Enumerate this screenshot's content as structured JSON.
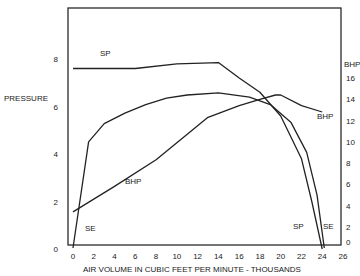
{
  "chart_data": {
    "type": "line",
    "title": "",
    "xlabel": "AIR VOLUME IN CUBIC FEET PER MINUTE - THOUSANDS",
    "ylabel": "PRESSURE",
    "y2label": "BHP",
    "xlim": [
      0,
      26
    ],
    "ylim": [
      0,
      10
    ],
    "y2lim": [
      0,
      18
    ],
    "grid": false,
    "legend": "inline labels",
    "x_ticks": [
      "0",
      "2",
      "4",
      "6",
      "8",
      "10",
      "12",
      "14",
      "16",
      "18",
      "20",
      "22",
      "24",
      "26"
    ],
    "y_ticks": [
      "0",
      "2",
      "4",
      "6",
      "8"
    ],
    "y2_ticks": [
      "0",
      "2",
      "4",
      "6",
      "8",
      "10",
      "12",
      "14",
      "16"
    ],
    "series": [
      {
        "name": "SP",
        "axis": "left",
        "description": "Static pressure",
        "x": [
          0,
          6,
          10,
          14,
          16,
          18,
          20,
          22,
          23,
          24
        ],
        "y": [
          7.6,
          7.6,
          7.8,
          7.85,
          7.2,
          6.6,
          5.6,
          3.8,
          2.0,
          0.0
        ]
      },
      {
        "name": "SE",
        "axis": "right",
        "description": "Static efficiency",
        "x": [
          0,
          1.5,
          3,
          5,
          7,
          9,
          11,
          14,
          17,
          19,
          21,
          22.5,
          23.5,
          24.2
        ],
        "y": [
          0,
          10.0,
          11.7,
          12.7,
          13.5,
          14.1,
          14.4,
          14.6,
          14.2,
          13.5,
          11.8,
          9.0,
          5.0,
          0.0
        ]
      },
      {
        "name": "BHP",
        "axis": "right",
        "description": "Brake horsepower",
        "x": [
          0,
          4,
          8,
          13,
          16,
          18,
          19.5,
          20,
          22,
          24
        ],
        "y": [
          3.4,
          5.8,
          8.3,
          12.3,
          13.4,
          14.0,
          14.4,
          14.4,
          13.4,
          12.8
        ]
      }
    ],
    "annotations": [
      {
        "text": "SP",
        "x": 4,
        "y_left": 8.2
      },
      {
        "text": "BHP",
        "x": 8,
        "y_left": 2.9
      },
      {
        "text": "SE",
        "x": 1.5,
        "y_left": 1.0
      },
      {
        "text": "BHP",
        "x": 24.5,
        "y_left": 5.6
      },
      {
        "text": "SP",
        "x": 22.5,
        "y_left": 0.9
      },
      {
        "text": "SE",
        "x": 25,
        "y_left": 0.9
      }
    ]
  },
  "labels": {
    "left_axis": "PRESSURE",
    "right_axis": "BHP",
    "x_axis": "AIR VOLUME IN CUBIC FEET PER MINUTE - THOUSANDS",
    "sp_top": "SP",
    "bhp_mid": "BHP",
    "se_low": "SE",
    "bhp_right": "BHP",
    "sp_bottom": "SP",
    "se_bottom": "SE"
  }
}
